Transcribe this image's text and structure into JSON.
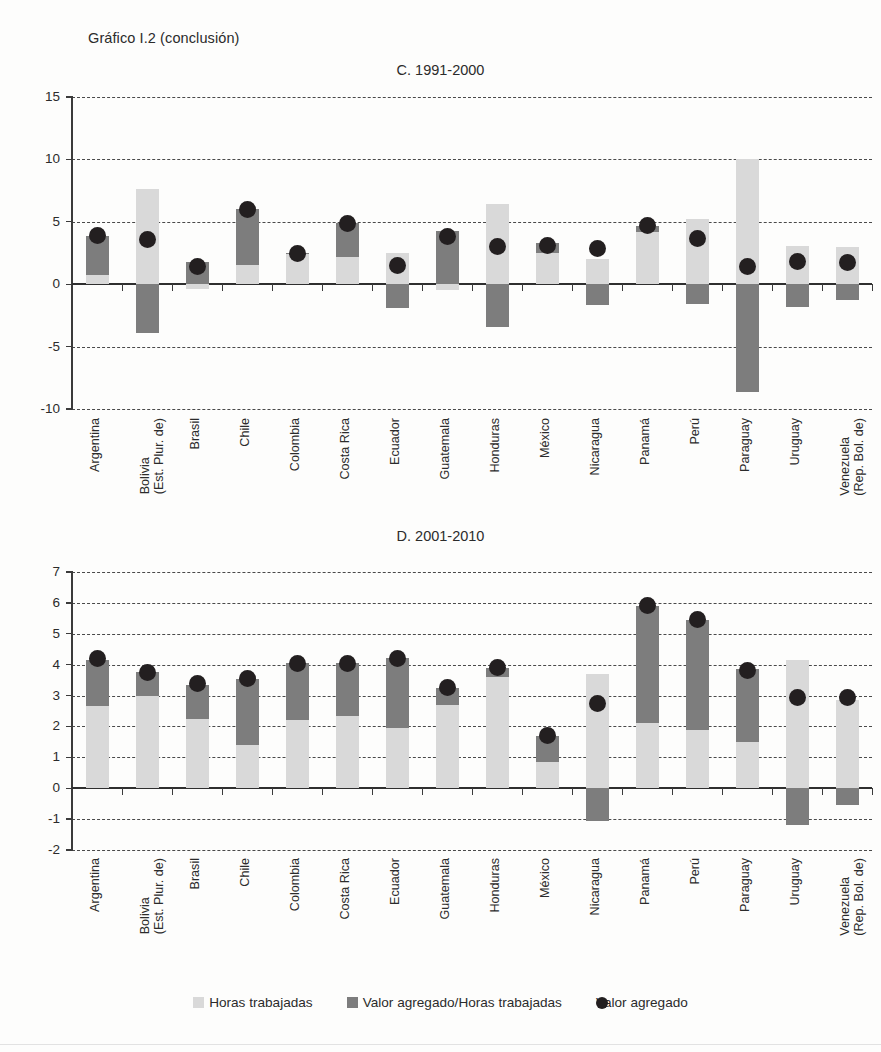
{
  "figure": {
    "title": "Gráfico I.2 (conclusión)"
  },
  "legend": {
    "items": [
      {
        "label": "Horas trabajadas",
        "marker": "light-square",
        "color": "#d9d9d9"
      },
      {
        "label": "Valor agregado/Horas trabajadas",
        "marker": "dark-square",
        "color": "#7d7d7d"
      },
      {
        "label": "Valor agregado",
        "marker": "black-circle",
        "color": "#231f20"
      }
    ]
  },
  "countries": [
    "Argentina",
    "Bolivia\n(Est. Plur. de)",
    "Brasil",
    "Chile",
    "Colombia",
    "Costa Rica",
    "Ecuador",
    "Guatemala",
    "Honduras",
    "México",
    "Nicaragua",
    "Panamá",
    "Perú",
    "Paraguay",
    "Uruguay",
    "Venezuela\n(Rep. Bol. de)"
  ],
  "chart_data": [
    {
      "type": "bar",
      "title": "C. 1991-2000",
      "xlabel": "",
      "ylabel": "",
      "ylim": [
        -10,
        15
      ],
      "yticks": [
        -10,
        -5,
        0,
        5,
        10,
        15
      ],
      "grid": true,
      "legend_position": "bottom",
      "stacked": true,
      "categories": [
        "Argentina",
        "Bolivia (Est. Plur. de)",
        "Brasil",
        "Chile",
        "Colombia",
        "Costa Rica",
        "Ecuador",
        "Guatemala",
        "Honduras",
        "México",
        "Nicaragua",
        "Panamá",
        "Perú",
        "Paraguay",
        "Uruguay",
        "Venezuela (Rep. Bol. de)"
      ],
      "series": [
        {
          "name": "Horas trabajadas",
          "values": [
            0.7,
            7.6,
            -0.4,
            1.5,
            2.4,
            2.2,
            2.5,
            -0.5,
            6.4,
            2.5,
            2.0,
            4.2,
            5.2,
            10.0,
            3.1,
            3.0
          ]
        },
        {
          "name": "Valor agregado/Horas trabajadas",
          "values": [
            3.2,
            -3.9,
            1.8,
            4.5,
            0.1,
            2.7,
            -1.9,
            4.3,
            -3.4,
            0.8,
            -1.7,
            0.5,
            -1.6,
            -8.6,
            -1.8,
            -1.3
          ]
        },
        {
          "name": "Valor agregado",
          "values": [
            3.9,
            3.6,
            1.4,
            6.0,
            2.5,
            4.9,
            1.5,
            3.8,
            3.0,
            3.1,
            2.9,
            4.7,
            3.7,
            1.4,
            1.8,
            1.7
          ]
        }
      ]
    },
    {
      "type": "bar",
      "title": "D. 2001-2010",
      "xlabel": "",
      "ylabel": "",
      "ylim": [
        -2,
        7
      ],
      "yticks": [
        -2,
        -1,
        0,
        1,
        2,
        3,
        4,
        5,
        6,
        7
      ],
      "grid": true,
      "legend_position": "bottom",
      "stacked": true,
      "categories": [
        "Argentina",
        "Bolivia (Est. Plur. de)",
        "Brasil",
        "Chile",
        "Colombia",
        "Costa Rica",
        "Ecuador",
        "Guatemala",
        "Honduras",
        "México",
        "Nicaragua",
        "Panamá",
        "Perú",
        "Paraguay",
        "Uruguay",
        "Venezuela (Rep. Bol. de)"
      ],
      "series": [
        {
          "name": "Horas trabajadas",
          "values": [
            2.65,
            3.0,
            2.25,
            1.4,
            2.2,
            2.35,
            1.95,
            2.7,
            3.6,
            0.85,
            3.7,
            2.1,
            1.9,
            1.5,
            4.15,
            2.85
          ]
        },
        {
          "name": "Valor agregado/Horas trabajadas",
          "values": [
            1.5,
            0.75,
            1.1,
            2.15,
            1.85,
            1.7,
            2.25,
            0.55,
            0.3,
            0.85,
            -1.05,
            3.8,
            3.55,
            2.35,
            -1.2,
            -0.55
          ]
        },
        {
          "name": "Valor agregado",
          "values": [
            4.2,
            3.75,
            3.4,
            3.55,
            4.05,
            4.05,
            4.2,
            3.25,
            3.9,
            1.7,
            2.75,
            5.9,
            5.45,
            3.8,
            2.95,
            2.95
          ]
        }
      ]
    }
  ]
}
